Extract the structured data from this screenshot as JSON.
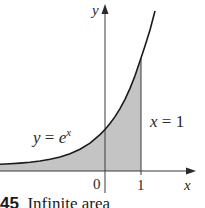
{
  "figure": {
    "function_label_y": "y",
    "function_label_eq": " = ",
    "function_label_base": "e",
    "function_label_exp": "x",
    "boundary_label_var": "x",
    "boundary_label_eq": " = 1",
    "axis_y_label": "y",
    "axis_x_label": "x",
    "tick_zero": "0",
    "tick_one": "1",
    "shade_color": "#c4c4c4",
    "curve_color": "#1a1a1a",
    "axis_color": "#3a3a3a"
  },
  "caption": {
    "number": "45",
    "text": "Infinite area"
  }
}
